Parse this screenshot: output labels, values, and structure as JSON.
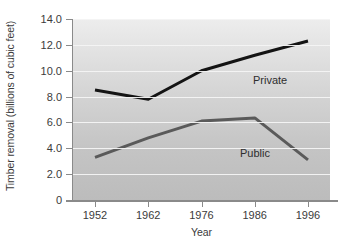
{
  "chart_data": {
    "type": "line",
    "title": "",
    "xlabel": "Year",
    "ylabel": "Timber removal (billions of cubic feet)",
    "categories": [
      "1952",
      "1962",
      "1976",
      "1986",
      "1996"
    ],
    "x": [
      1952,
      1962,
      1976,
      1986,
      1996
    ],
    "series": [
      {
        "name": "Private",
        "values": [
          8.5,
          7.8,
          10.0,
          11.2,
          12.3
        ],
        "color": "#141414"
      },
      {
        "name": "Public",
        "values": [
          3.3,
          4.8,
          6.1,
          6.35,
          3.1
        ],
        "color": "#5a5a5a"
      }
    ],
    "ylim": [
      0,
      14
    ],
    "yticks": [
      "14.0",
      "12.0",
      "10.0",
      "8.0",
      "6.0",
      "4.0",
      "2.0",
      "0"
    ],
    "ytick_values": [
      14,
      12,
      10,
      8,
      6,
      4,
      2,
      0
    ],
    "grid": true,
    "legend": "inline-labels",
    "plot_background": "#d2d2d2",
    "gridline_color": "#f4f4f4"
  },
  "axes": {
    "y_title": "Timber removal (billions of cubic feet)",
    "x_title": "Year"
  },
  "labels": {
    "private": "Private",
    "public": "Public"
  }
}
